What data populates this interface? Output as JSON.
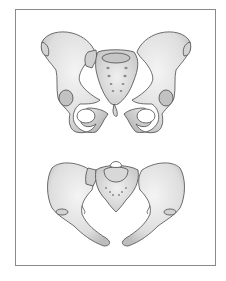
{
  "figure": {
    "frame_border_color": "#8a8a8a",
    "bone_fill": "#e6e6e6",
    "bone_shade": "#c8c8c8",
    "outline_color": "#4a4a4a",
    "panels": [
      {
        "id": "pelvis-anterior",
        "view": "anterior (front) view of pelvis"
      },
      {
        "id": "pelvis-superior",
        "view": "superior (top-down) view of pelvis"
      }
    ]
  }
}
